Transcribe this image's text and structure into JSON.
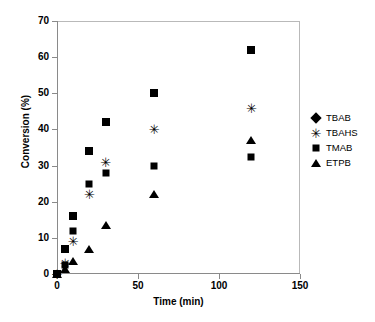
{
  "chart_data": {
    "type": "scatter",
    "title": "",
    "xlabel": "Time (min)",
    "ylabel": "Conversion (%)",
    "xlim": [
      0,
      150
    ],
    "ylim": [
      0,
      70
    ],
    "xticks": [
      0,
      50,
      100,
      150
    ],
    "yticks": [
      0,
      10,
      20,
      30,
      40,
      50,
      60,
      70
    ],
    "grid": false,
    "legend_position": "right",
    "x": [
      0,
      5,
      10,
      20,
      30,
      60,
      120
    ],
    "series": [
      {
        "name": "TBAB",
        "marker": "diamond",
        "color": "#000000",
        "values": [
          0,
          7,
          16,
          34,
          42,
          50,
          62
        ]
      },
      {
        "name": "TBAHS",
        "marker": "asterisk",
        "color": "#000000",
        "values": [
          0,
          3,
          9,
          22,
          31,
          40,
          46
        ]
      },
      {
        "name": "TMAB",
        "marker": "square",
        "color": "#000000",
        "values": [
          0,
          2.5,
          12,
          25,
          28,
          30,
          32.5
        ]
      },
      {
        "name": "ETPB",
        "marker": "triangle",
        "color": "#000000",
        "values": [
          0,
          1.5,
          3.5,
          7,
          13.5,
          22,
          37
        ]
      }
    ]
  },
  "axes": {
    "x_tick_labels": [
      "0",
      "50",
      "100",
      "150"
    ],
    "y_tick_labels": [
      "0",
      "10",
      "20",
      "30",
      "40",
      "50",
      "60",
      "70"
    ]
  },
  "legend": {
    "entries": [
      {
        "label": "TBAB",
        "marker": "diamond"
      },
      {
        "label": "TBAHS",
        "marker": "asterisk"
      },
      {
        "label": "TMAB",
        "marker": "square"
      },
      {
        "label": "ETPB",
        "marker": "triangle"
      }
    ]
  },
  "glyphs": {
    "asterisk": "✳"
  },
  "style": {
    "frame_color": "#b9b9b9",
    "axis_color": "#8a8a8a",
    "marker_color": "#000000",
    "background": "#ffffff"
  }
}
